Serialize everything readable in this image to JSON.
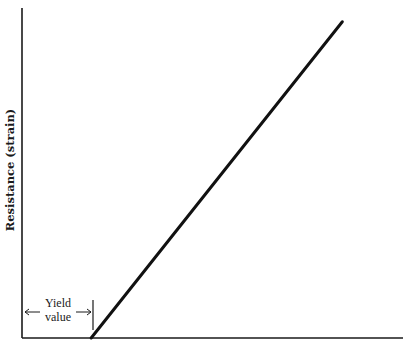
{
  "chart_data": {
    "type": "line",
    "title": "",
    "ylabel": "Resistance (strain)",
    "xlabel": "",
    "x_range": [
      0,
      1
    ],
    "y_range": [
      0,
      1
    ],
    "grid": false,
    "series": [
      {
        "name": "flow curve",
        "points": [
          [
            0.19,
            0.0
          ],
          [
            0.88,
            0.97
          ]
        ]
      }
    ],
    "annotations": [
      {
        "text_line1": "Yield",
        "text_line2": "value",
        "spans_x": [
          0.0,
          0.19
        ],
        "description": "double-headed arrow from origin to yield point"
      }
    ]
  }
}
